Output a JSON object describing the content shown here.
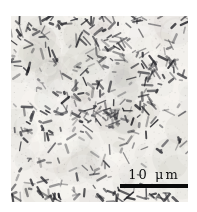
{
  "figure": {
    "type": "micrograph",
    "scale_bar": {
      "label": "10 μm",
      "bar_color": "#0a0a0a",
      "text_color": "#101010"
    },
    "palette": {
      "page_bg": "#ffffff",
      "image_bg": "#edebe7",
      "mottle_dark": "#b2b0ab",
      "mottle_light": "#f7f6f3",
      "particle": "#26262b"
    },
    "render": {
      "seed": 1337,
      "particle_count": 380,
      "cluster_count": 14,
      "edge_particle_count": 60,
      "speck_count": 750
    }
  }
}
